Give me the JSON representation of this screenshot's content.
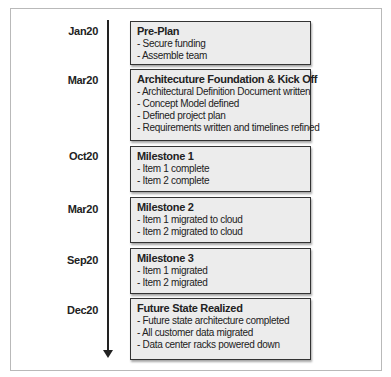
{
  "timeline": {
    "entries": [
      {
        "date": "Jan20",
        "title": "Pre-Plan",
        "items": [
          "- Secure funding",
          "- Assemble team"
        ]
      },
      {
        "date": "Mar20",
        "title": "Architecuture Foundation & Kick Off",
        "items": [
          "- Architectural Definition Document written",
          "- Concept Model defined",
          "- Defined project plan",
          "- Requirements written and timelines refined"
        ]
      },
      {
        "date": "Oct20",
        "title": "Milestone 1",
        "items": [
          "- Item 1 complete",
          "- Item 2 complete"
        ]
      },
      {
        "date": "Mar20",
        "title": "Milestone 2",
        "items": [
          "- Item 1 migrated to cloud",
          "- Item 2 migrated to cloud"
        ]
      },
      {
        "date": "Sep20",
        "title": "Milestone 3",
        "items": [
          "- Item 1 migrated",
          "- Item 2 migrated"
        ]
      },
      {
        "date": "Dec20",
        "title": "Future State Realized",
        "items": [
          "- Future state architecture completed",
          "- All customer data migrated",
          "- Data center racks powered down"
        ]
      }
    ]
  },
  "colors": {
    "box_fill": "#ececec",
    "box_border": "#333333",
    "axis": "#222222",
    "frame_border": "#b9b9b9"
  }
}
